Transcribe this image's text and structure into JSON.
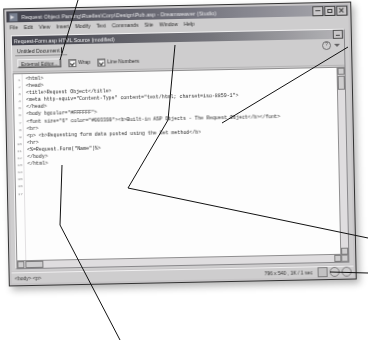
{
  "window": {
    "title": "Request Object Parsing\\Ruelles\\Corp\\Design\\Pub.asp - Dreamweaver (Studio)",
    "icon": "dreamweaver-icon",
    "controls": {
      "minimize_label": "_",
      "maximize_label": "[]",
      "close_label": "x"
    }
  },
  "menubar": {
    "items": [
      {
        "label": "File"
      },
      {
        "label": "Edit"
      },
      {
        "label": "View"
      },
      {
        "label": "Insert"
      },
      {
        "label": "Modify"
      },
      {
        "label": "Text"
      },
      {
        "label": "Commands"
      },
      {
        "label": "Site"
      },
      {
        "label": "Window"
      },
      {
        "label": "Help"
      }
    ]
  },
  "document": {
    "title": "Request-Form.asp  HTML Source (modified)",
    "minimize_label": "_"
  },
  "object_row": {
    "field_value": "Untitled Document",
    "help_label": "?",
    "menu_arrow": "triangle-down-icon"
  },
  "toolbar": {
    "external_editor_label": "External Editor...",
    "wrap_label": "Wrap",
    "wrap_checked": true,
    "line_numbers_label": "Line Numbers",
    "line_numbers_checked": true
  },
  "code": {
    "lines": [
      {
        "num": "1",
        "text": "<html>"
      },
      {
        "num": "2",
        "text": "<head>"
      },
      {
        "num": "3",
        "text": "<title>Request Object</title>"
      },
      {
        "num": "4",
        "text": "<meta http-equiv=\"Content-Type\" content=\"text/html; charset=iso-8859-1\">"
      },
      {
        "num": "5",
        "text": "</head>"
      },
      {
        "num": "6",
        "text": ""
      },
      {
        "num": "7",
        "text": "<body bgcolor=\"#FFFFFF\">"
      },
      {
        "num": "8",
        "text": "<font size=\"6\" color=\"#003399\"><b>Built-in ASP Objects - The Request Object</b></font>"
      },
      {
        "num": "9",
        "text": "<br>"
      },
      {
        "num": "10",
        "text": "<p> <b>Requesting form data posted using the Get method</b>"
      },
      {
        "num": "11",
        "text": "<hr>"
      },
      {
        "num": "12",
        "text": ""
      },
      {
        "num": "13",
        "text": "<%=Request.Form(\"Name\")%>"
      },
      {
        "num": "14",
        "text": ""
      },
      {
        "num": "15",
        "text": "</body>"
      },
      {
        "num": "16",
        "text": "</html>"
      },
      {
        "num": "17",
        "text": ""
      }
    ]
  },
  "statusbar": {
    "left_text": "<body> <p>",
    "size_text": "796 x 540 , 1K / 1 sec",
    "icons": [
      "launcher-icon",
      "globe-icon",
      "preview-icon"
    ]
  },
  "annotations": {
    "leader_lines": [
      {
        "name": "callout-titlebar",
        "points": "78,0 60,60"
      },
      {
        "name": "callout-code-pane",
        "points": "120,340 60,225 62,165"
      },
      {
        "name": "callout-doc-window",
        "points": "368,238 128,188 168,120 175,45"
      },
      {
        "name": "callout-scroll",
        "points": "368,273 330,272"
      },
      {
        "name": "callout-maximize",
        "points": "348,47 222,123"
      }
    ]
  }
}
